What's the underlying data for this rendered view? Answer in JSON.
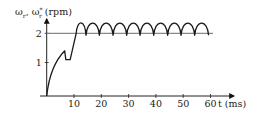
{
  "chart_data": {
    "type": "line",
    "title": "",
    "ylabel": "ωr, ωr* (rpm)",
    "ylabel_parts": {
      "w1": "ω",
      "s1": "r",
      "sep": ", ",
      "w2": "ω",
      "s2": "r",
      "sup": "*",
      "unit": " (rpm)"
    },
    "xlabel": "t (ms)",
    "xlim": [
      0,
      62
    ],
    "ylim": [
      0,
      2.4
    ],
    "x_ticks": [
      10,
      20,
      30,
      40,
      50,
      60
    ],
    "x_tick_labels": [
      "10",
      "20",
      "30",
      "40",
      "50",
      "60"
    ],
    "y_ticks": [
      1,
      2
    ],
    "y_tick_labels": [
      "1",
      "2"
    ],
    "grid": false,
    "legend": null,
    "series": [
      {
        "name": "ωr* (reference)",
        "style": "gray-line",
        "x": [
          0,
          60.9
        ],
        "y": [
          2,
          2
        ]
      },
      {
        "name": "ωr (actual)",
        "style": "black-curve",
        "x": [
          0,
          2,
          4,
          6,
          6.6,
          7.0,
          8.6,
          10.8,
          12.2,
          14.4,
          19.3,
          24.3,
          29.3,
          34.2,
          39.2,
          44.3,
          49.2,
          54.2,
          60.3
        ],
        "y": [
          0,
          0.65,
          1.05,
          1.3,
          1.4,
          1.1,
          1.1,
          2.0,
          2.35,
          1.95,
          1.95,
          1.95,
          1.95,
          1.95,
          1.95,
          1.95,
          1.95,
          1.95,
          1.95
        ],
        "ripple": {
          "period_ms": 5.0,
          "min": 1.95,
          "max": 2.35,
          "start_ms": 10.8,
          "end_ms": 60.3
        }
      }
    ]
  }
}
